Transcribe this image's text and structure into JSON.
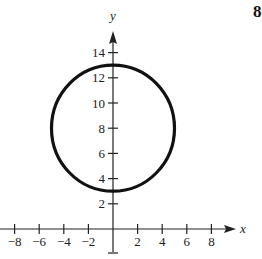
{
  "chart_data": {
    "type": "line",
    "title": "",
    "xlabel": "x",
    "ylabel": "y",
    "xlim": [
      -8.5,
      9.5
    ],
    "ylim": [
      -1,
      16
    ],
    "grid": false,
    "x_ticks": [
      -8,
      -6,
      -4,
      -2,
      2,
      4,
      6,
      8
    ],
    "x_tick_labels": [
      "−8",
      "−6",
      "−4",
      "−2",
      "2",
      "4",
      "6",
      "8"
    ],
    "y_ticks": [
      2,
      4,
      6,
      8,
      10,
      12,
      14
    ],
    "y_tick_labels": [
      "2",
      "4",
      "6",
      "8",
      "10",
      "12",
      "14"
    ],
    "series": [
      {
        "name": "circle",
        "shape": "circle",
        "center": [
          0,
          8
        ],
        "radius": 5,
        "equation": "x^2 + (y - 8)^2 = 25",
        "color": "#111111"
      }
    ]
  },
  "page": {
    "stray_label": "8"
  }
}
